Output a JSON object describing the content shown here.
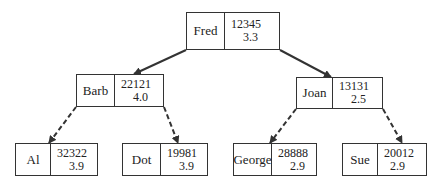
{
  "tree": {
    "nodes": [
      {
        "id": "fred",
        "name": "Fred",
        "key": "12345",
        "value": "3.3",
        "x": 186,
        "y": 12,
        "w": 94,
        "h": 38,
        "split": 37
      },
      {
        "id": "barb",
        "name": "Barb",
        "key": "22121",
        "value": "4.0",
        "x": 76,
        "y": 74,
        "w": 88,
        "h": 33,
        "split": 37
      },
      {
        "id": "joan",
        "name": "Joan",
        "key": "13131",
        "value": "2.5",
        "x": 296,
        "y": 77,
        "w": 87,
        "h": 32,
        "split": 35
      },
      {
        "id": "al",
        "name": "Al",
        "key": "32322",
        "value": "3.9",
        "x": 15,
        "y": 143,
        "w": 83,
        "h": 33,
        "split": 34
      },
      {
        "id": "dot",
        "name": "Dot",
        "key": "19981",
        "value": "3.9",
        "x": 122,
        "y": 143,
        "w": 86,
        "h": 33,
        "split": 37
      },
      {
        "id": "george",
        "name": "George",
        "key": "28888",
        "value": "2.9",
        "x": 233,
        "y": 143,
        "w": 84,
        "h": 33,
        "split": 37
      },
      {
        "id": "sue",
        "name": "Sue",
        "key": "20012",
        "value": "2.9",
        "x": 342,
        "y": 143,
        "w": 85,
        "h": 33,
        "split": 34
      }
    ],
    "edges": [
      {
        "from": "fred",
        "to": "barb",
        "style": "solid"
      },
      {
        "from": "fred",
        "to": "joan",
        "style": "solid"
      },
      {
        "from": "barb",
        "to": "al",
        "style": "dashed"
      },
      {
        "from": "barb",
        "to": "dot",
        "style": "dashed"
      },
      {
        "from": "joan",
        "to": "george",
        "style": "dashed"
      },
      {
        "from": "joan",
        "to": "sue",
        "style": "dashed"
      }
    ]
  },
  "colors": {
    "line": "#333333",
    "background": "#ffffff"
  }
}
